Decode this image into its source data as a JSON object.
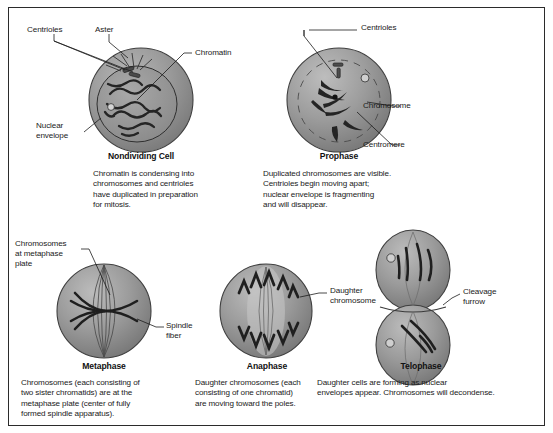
{
  "figure": {
    "border_color": "#2b2b2b",
    "background": "#ffffff",
    "cell_fill": "#8e8e8e",
    "cell_stroke": "#3a3a3a",
    "chromatin_color": "#2a2a2a"
  },
  "panels": [
    {
      "id": "nondividing-cell",
      "phase": "Nondividing Cell",
      "caption": "Chromatin is condensing into\nchromosomes and centrioles\nhave duplicated in preparation\nfor mitosis.",
      "labels": [
        {
          "id": "centrioles",
          "text": "Centrioles"
        },
        {
          "id": "aster",
          "text": "Aster"
        },
        {
          "id": "chromatin",
          "text": "Chromatin"
        },
        {
          "id": "nuclear-envelope",
          "text": "Nuclear\nenvelope"
        }
      ]
    },
    {
      "id": "prophase",
      "phase": "Prophase",
      "caption": "Duplicated chromosomes are visible.\nCentrioles begin moving apart;\nnuclear envelope is fragmenting\nand will disappear.",
      "labels": [
        {
          "id": "centrioles",
          "text": "Centrioles"
        },
        {
          "id": "chromosome",
          "text": "Chromosome"
        },
        {
          "id": "centromere",
          "text": "Centromere"
        }
      ]
    },
    {
      "id": "metaphase",
      "phase": "Metaphase",
      "caption": "Chromosomes (each consisting of\ntwo sister chromatids) are at the\nmetaphase plate (center of fully\nformed spindle apparatus).",
      "labels": [
        {
          "id": "chromosomes-at-metaphase-plate",
          "text": "Chromosomes\nat metaphase\nplate"
        },
        {
          "id": "spindle-fiber",
          "text": "Spindle\nfiber"
        }
      ]
    },
    {
      "id": "anaphase",
      "phase": "Anaphase",
      "caption": "Daughter chromosomes (each\nconsisting of one chromatid)\nare moving toward the poles.",
      "labels": [
        {
          "id": "daughter-chromosome",
          "text": "Daughter\nchromosome"
        }
      ]
    },
    {
      "id": "telophase",
      "phase": "Telophase",
      "caption": "Daughter cells are forming as nuclear\nenvelopes appear. Chromosomes will decondense.",
      "labels": [
        {
          "id": "cleavage-furrow",
          "text": "Cleavage\nfurrow"
        }
      ]
    }
  ]
}
